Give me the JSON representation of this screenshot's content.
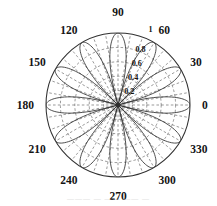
{
  "figure": {
    "name": "polar-radiation-pattern",
    "background_color": "#ffffff",
    "line_color": "#303030",
    "grid_color": "#555555"
  },
  "chart_data": {
    "type": "line",
    "subtype": "polar",
    "title": "",
    "xlabel": "",
    "ylabel": "",
    "grid": true,
    "legend": null,
    "angle_unit": "degrees",
    "angle_tick_labels": [
      "0",
      "30",
      "60",
      "90",
      "120",
      "150",
      "180",
      "210",
      "240",
      "270",
      "300",
      "330"
    ],
    "angle_ticks": [
      0,
      30,
      60,
      90,
      120,
      150,
      180,
      210,
      240,
      270,
      300,
      330
    ],
    "angle_minor_ticks": [
      10,
      20,
      40,
      50,
      70,
      80,
      100,
      110,
      130,
      140,
      160,
      170,
      190,
      200,
      220,
      230,
      250,
      260,
      280,
      290,
      310,
      320,
      340,
      350
    ],
    "radial_tick_labels": [
      "0.2",
      "0.4",
      "0.6",
      "0.8",
      "1"
    ],
    "radial_ticks": [
      0.2,
      0.4,
      0.6,
      0.8,
      1.0
    ],
    "rlim": [
      0,
      1
    ],
    "radial_label_angle_deg": 75,
    "outer_label": "1",
    "lobe_count": 12,
    "lobe_half_width_deg": 15,
    "lobe_peak_angles_deg": [
      0,
      30,
      60,
      90,
      120,
      150,
      180,
      210,
      240,
      270,
      300,
      330
    ],
    "lobe_peak_values": [
      1,
      1,
      1,
      1,
      1,
      1,
      1,
      1,
      1,
      1,
      1,
      1
    ],
    "series": [
      {
        "name": "normalized array factor",
        "description": "multi-lobe polar pattern with 12 equal lobes peaking at each 30 degree multiple and nulls between",
        "values": [
          1,
          1,
          1,
          1,
          1,
          1,
          1,
          1,
          1,
          1,
          1,
          1
        ]
      }
    ]
  },
  "caption": {
    "ghost_text": "———   —  ——  —— —"
  }
}
